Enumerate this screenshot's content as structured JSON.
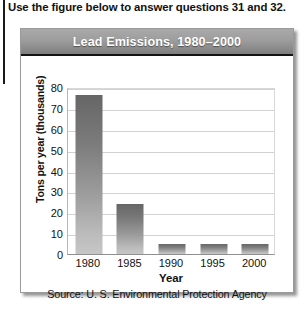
{
  "question_prompt": "Use the figure below to answer questions 31 and 32.",
  "figure": {
    "title": "Lead Emissions, 1980–2000",
    "source": "Source: U. S. Environmental Protection Agency",
    "title_bar_color": "#9d9d9d",
    "title_text_color": "#ffffff",
    "bar_color_top": "#666666",
    "bar_color_bottom": "#c6c6c6",
    "gridline_color": "#d2d2d2"
  },
  "chart_data": {
    "type": "bar",
    "title": "Lead Emissions, 1980–2000",
    "xlabel": "Year",
    "ylabel": "Tons per year (thousands)",
    "categories": [
      "1980",
      "1985",
      "1990",
      "1995",
      "2000"
    ],
    "values": [
      76,
      24,
      5,
      5,
      5
    ],
    "ylim": [
      0,
      80
    ],
    "ytick_step": 10,
    "yticks": [
      "80",
      "70",
      "60",
      "50",
      "40",
      "30",
      "20",
      "10",
      "0"
    ],
    "grid": true,
    "legend": false,
    "source": "Source: U. S. Environmental Protection Agency"
  }
}
